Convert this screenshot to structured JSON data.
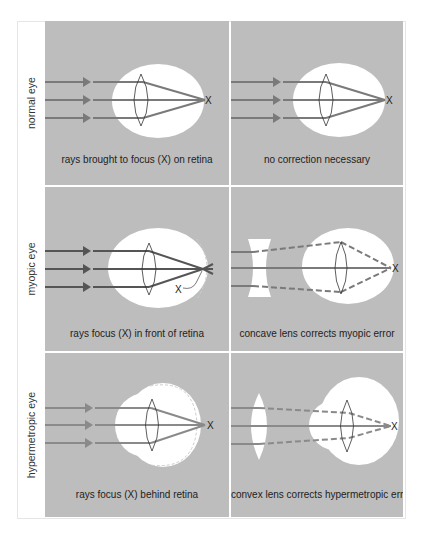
{
  "figure": {
    "rows": [
      {
        "label": "normal eye",
        "left_caption": "rays brought to focus (X) on retina",
        "right_caption": "no correction necessary",
        "focus_marker": "X"
      },
      {
        "label": "myopic eye",
        "left_caption": "rays focus (X) in front of retina",
        "right_caption": "concave lens corrects myopic error",
        "focus_marker": "X"
      },
      {
        "label": "hypermetropic eye",
        "left_caption": "rays focus (X) behind retina",
        "right_caption": "convex lens corrects hypermetropic error",
        "focus_marker": "X"
      }
    ],
    "colors": {
      "panel_bg": "#bdbdbd",
      "eye": "#ffffff",
      "ray": "#7a7a7a",
      "ray_dark": "#555555",
      "text": "#222222"
    }
  }
}
